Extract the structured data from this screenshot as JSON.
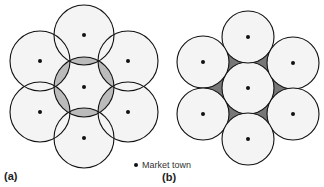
{
  "figure": {
    "panel_a": {
      "label": "(a)",
      "description": "Overlapping market areas (circles overlap)",
      "radius": 30,
      "towns": [
        [
          84,
          87
        ],
        [
          84,
          35
        ],
        [
          40,
          61
        ],
        [
          128,
          61
        ],
        [
          40,
          112
        ],
        [
          128,
          112
        ],
        [
          84,
          138
        ]
      ]
    },
    "panel_b": {
      "label": "(b)",
      "description": "Tangent market areas leaving unserved gaps (shaded)",
      "radius": 26,
      "towns": [
        [
          248,
          88
        ],
        [
          248,
          37
        ],
        [
          203,
          62
        ],
        [
          293,
          63
        ],
        [
          203,
          114
        ],
        [
          293,
          114
        ],
        [
          248,
          139
        ]
      ]
    },
    "legend": {
      "label": "Market town"
    },
    "colors": {
      "stroke": "#111111",
      "fill": "#f4f4f4",
      "gap": "#777777",
      "overlap": "#bbbbbb"
    }
  }
}
